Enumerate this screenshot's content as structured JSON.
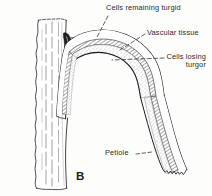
{
  "figure": {
    "letter": "B",
    "caption_labels": {
      "cells_remaining_turgid": "Cells remaining turgid",
      "vascular_tissue": "Vascular tissue",
      "cells_losing_turgor": "Cells losing turgor",
      "petiole": "Petiole"
    },
    "colors": {
      "ink": "#2a2a2a",
      "outline": "#1b1b1b",
      "background": "#fdfdfc",
      "stipple": "#8d8d8d",
      "shade": "#b5b5b5"
    },
    "parts": [
      "stem",
      "petiole",
      "vascular-tissue-band",
      "turgid-cell-layer",
      "losing-turgor-cell-layer",
      "leaf-scar-bud"
    ]
  }
}
